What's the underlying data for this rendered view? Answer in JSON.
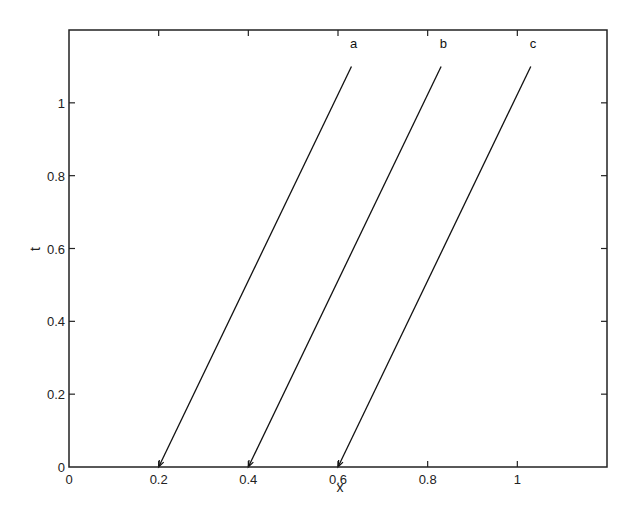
{
  "chart_data": {
    "type": "line",
    "title": "",
    "xlabel": "x",
    "ylabel": "t",
    "xlim": [
      0,
      1.2
    ],
    "ylim": [
      0,
      1.2
    ],
    "xticks": [
      0,
      0.2,
      0.4,
      0.6,
      0.8,
      1
    ],
    "xtick_labels": [
      "0",
      "0.2",
      "0.4",
      "0.6",
      "0.8",
      "1"
    ],
    "yticks": [
      0,
      0.2,
      0.4,
      0.6,
      0.8,
      1
    ],
    "ytick_labels": [
      "0",
      "0.2",
      "0.4",
      "0.6",
      "0.8",
      "1"
    ],
    "grid": false,
    "legend": null,
    "series": [
      {
        "name": "a",
        "x": [
          0.2,
          0.63
        ],
        "y": [
          0,
          1.1
        ],
        "arrow_at": "start"
      },
      {
        "name": "b",
        "x": [
          0.4,
          0.83
        ],
        "y": [
          0,
          1.1
        ],
        "arrow_at": "start"
      },
      {
        "name": "c",
        "x": [
          0.6,
          1.03
        ],
        "y": [
          0,
          1.1
        ],
        "arrow_at": "start"
      }
    ],
    "annotations": [
      {
        "text": "a",
        "x": 0.635,
        "y": 1.15
      },
      {
        "text": "b",
        "x": 0.835,
        "y": 1.15
      },
      {
        "text": "c",
        "x": 1.035,
        "y": 1.15
      }
    ],
    "colors": {
      "line": "#111111",
      "axes": "#222222",
      "background": "#ffffff"
    }
  }
}
